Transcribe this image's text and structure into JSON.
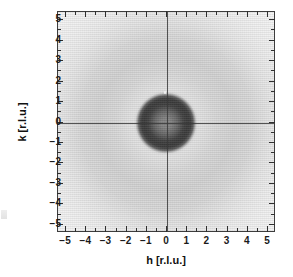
{
  "figure": {
    "type": "grayscale-intensity-map"
  },
  "axes": {
    "x": {
      "label": "h [r.l.u.]",
      "min": -5.4,
      "max": 5.4,
      "major_ticks": [
        -5,
        -4,
        -3,
        -2,
        -1,
        0,
        1,
        2,
        3,
        4,
        5
      ],
      "tick_labels": [
        "-5",
        "-4",
        "-3",
        "-2",
        "-1",
        "0",
        "1",
        "2",
        "3",
        "4",
        "5"
      ],
      "minor_tick_step": 0.5
    },
    "y": {
      "label": "k [r.l.u.]",
      "min": -5.4,
      "max": 5.4,
      "major_ticks": [
        -5,
        -4,
        -3,
        -2,
        -1,
        0,
        1,
        2,
        3,
        4,
        5
      ],
      "tick_labels": [
        "-5",
        "-4",
        "-3",
        "-2",
        "-1",
        "0",
        "1",
        "2",
        "3",
        "4",
        "5"
      ],
      "minor_tick_step": 0.5
    }
  },
  "crosshair": {
    "h": 0,
    "k": 0
  },
  "annotations": {
    "speck": {
      "h": -0.1,
      "k": 1.5,
      "kind": "bright-pixel-artifact"
    }
  },
  "colors": {
    "background": "#ebebeb",
    "halo": "#d8d8d8",
    "ring_darkest": "#4a4a4a",
    "core": "#5c5c5c",
    "frame": "#3d3d3d",
    "crosshair": "#3a3a3a",
    "text": "#111111"
  },
  "chart_data": {
    "type": "heatmap",
    "title": "",
    "xlabel": "h [r.l.u.]",
    "ylabel": "k [r.l.u.]",
    "xlim": [
      -5.4,
      5.4
    ],
    "ylim": [
      -5.4,
      5.4
    ],
    "grid": false,
    "legend": "none",
    "colormap": "grayscale-inverted",
    "value_meaning": "scattering intensity (darker = higher intensity)",
    "radial_profile": {
      "r_rlu": [
        0.0,
        0.3,
        0.6,
        0.9,
        1.2,
        1.5,
        1.7,
        1.9,
        2.0,
        2.2,
        2.6,
        3.2,
        3.8,
        4.4,
        5.0,
        5.4
      ],
      "gray_level": [
        92,
        90,
        78,
        62,
        52,
        48,
        52,
        74,
        120,
        176,
        206,
        213,
        216,
        222,
        230,
        235
      ],
      "intensity": [
        0.64,
        0.65,
        0.69,
        0.76,
        0.8,
        0.81,
        0.8,
        0.71,
        0.53,
        0.31,
        0.19,
        0.16,
        0.15,
        0.13,
        0.1,
        0.08
      ]
    },
    "features": [
      {
        "name": "central annulus",
        "center": [
          0,
          0
        ],
        "radius_rlu": 1.5,
        "outer_radius_rlu": 1.9,
        "peak_gray": "#303030",
        "note": "ring-shaped maximum, slightly lighter core"
      },
      {
        "name": "diffuse halo",
        "center": [
          0,
          0
        ],
        "radius_rlu": 3.6,
        "peak_gray": "#d8d8d8",
        "note": "broad low-contrast ring filling the frame"
      }
    ]
  }
}
